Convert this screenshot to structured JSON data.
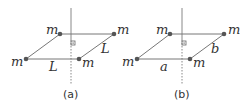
{
  "figure": {
    "width": 249,
    "height": 108,
    "colors": {
      "edge": "#777777",
      "axis": "#888888",
      "dot": "#555555",
      "text": "#333333"
    }
  },
  "panels": [
    {
      "caption": "(a)",
      "mass_label": "m",
      "side_labels": {
        "horizontal": "L",
        "slanted": "L"
      },
      "vertices": {
        "top_left": [
          60,
          34
        ],
        "top_right": [
          114,
          34
        ],
        "bottom_left": [
          26,
          59
        ],
        "bottom_right": [
          79,
          59
        ]
      },
      "axis_x": 71
    },
    {
      "caption": "(b)",
      "mass_label": "m",
      "side_labels": {
        "horizontal": "a",
        "slanted": "b"
      },
      "vertices": {
        "top_left": [
          170,
          34
        ],
        "top_right": [
          224,
          34
        ],
        "bottom_left": [
          137,
          59
        ],
        "bottom_right": [
          190,
          59
        ]
      },
      "axis_x": 182
    }
  ]
}
